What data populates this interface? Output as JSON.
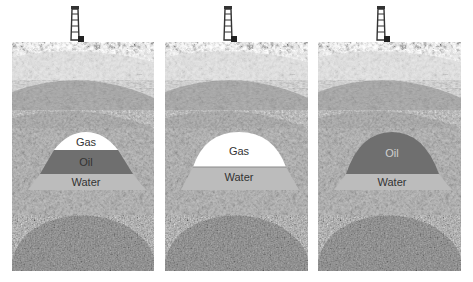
{
  "figure": {
    "title": "",
    "panels": [
      {
        "id": "gas-oil-water",
        "layers": [
          {
            "name": "gas",
            "label": "Gas"
          },
          {
            "name": "oil",
            "label": "Oil"
          },
          {
            "name": "water",
            "label": "Water"
          }
        ]
      },
      {
        "id": "gas-water",
        "layers": [
          {
            "name": "gas",
            "label": "Gas"
          },
          {
            "name": "water",
            "label": "Water"
          }
        ]
      },
      {
        "id": "oil-water",
        "layers": [
          {
            "name": "oil",
            "label": "Oil"
          },
          {
            "name": "water",
            "label": "Water"
          }
        ]
      }
    ]
  },
  "colors": {
    "gas": "#ffffff",
    "oil": "#6f6f6f",
    "water": "#bcbcbc",
    "oil_text_dark": "#444444",
    "oil_text_light": "#d0d0d0",
    "water_text": "#333333",
    "gas_text": "#333333"
  }
}
